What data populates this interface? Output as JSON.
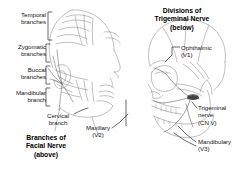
{
  "figure": {
    "width": 244,
    "height": 174,
    "background_color": "#ffffff",
    "ink_color": "#6f6f6f",
    "text_color": "#151515"
  },
  "titles": {
    "facial": "Branches of\nFacial Nerve\n(above)",
    "trigeminal": "Divisions of\nTrigeminal Nerve\n(below)"
  },
  "facial_nerve_branches": [
    {
      "id": "temporal",
      "label": "Temporal\nbranches",
      "align": "right"
    },
    {
      "id": "zygomatic",
      "label": "Zygomatic\nbranches",
      "align": "right"
    },
    {
      "id": "buccal",
      "label": "Buccal\nbranches",
      "align": "right"
    },
    {
      "id": "mandibular",
      "label": "Mandibular\nbranch",
      "align": "right"
    },
    {
      "id": "cervical",
      "label": "Cervical\nbranch",
      "align": "center"
    }
  ],
  "trigeminal_divisions": [
    {
      "id": "ophthalmic",
      "label": "Ophthalmic\n(V1)",
      "align": "left"
    },
    {
      "id": "maxillary",
      "label": "Maxillary\n(V2)",
      "align": "center"
    },
    {
      "id": "mandibulary",
      "label": "Mandibulary\n(V3)",
      "align": "left"
    }
  ],
  "nerve_trunk": {
    "id": "trigeminal-nerve",
    "label": "Trigeminal\nnerve\n(CN V)",
    "align": "left"
  }
}
